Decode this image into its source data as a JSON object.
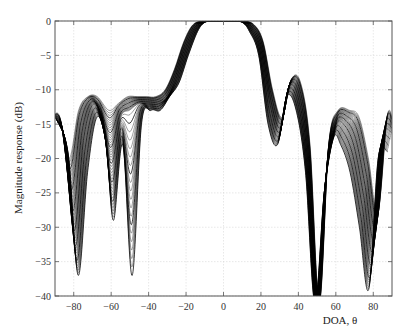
{
  "chart_data": {
    "type": "line",
    "title": "",
    "xlabel": "DOA, θ",
    "ylabel": "Magnitude response (dB)",
    "xlim": [
      -90,
      90
    ],
    "ylim": [
      -40,
      0
    ],
    "xticks": [
      -80,
      -60,
      -40,
      -20,
      0,
      20,
      40,
      60,
      80
    ],
    "yticks": [
      0,
      -5,
      -10,
      -15,
      -20,
      -25,
      -30,
      -35,
      -40
    ],
    "xtick_labels": [
      "−80",
      "−60",
      "−40",
      "−20",
      "0",
      "20",
      "40",
      "60",
      "80"
    ],
    "ytick_labels": [
      "0",
      "−5",
      "−10",
      "−15",
      "−20",
      "−25",
      "−30",
      "−35",
      "−40"
    ],
    "grid": true,
    "legend": null,
    "series_count": 40,
    "line_color": "#000000",
    "series": [
      {
        "name": "pattern-min",
        "x": [
          -90,
          -85,
          -80,
          -75,
          -70,
          -65,
          -60,
          -55,
          -50,
          -45,
          -40,
          -35,
          -30,
          -25,
          -20,
          -15,
          -10,
          -5,
          0,
          5,
          10,
          15,
          20,
          25,
          30,
          35,
          40,
          45,
          50,
          55,
          60,
          65,
          70,
          75,
          80,
          85,
          90
        ],
        "values": [
          -15,
          -20,
          -37,
          -22,
          -14,
          -18,
          -29,
          -18,
          -37,
          -15,
          -13,
          -13,
          -11,
          -9,
          -5,
          -1.5,
          -0.2,
          0,
          0,
          0,
          -0.2,
          -1.5,
          -5,
          -15,
          -18,
          -11,
          -13,
          -22,
          -40,
          -25,
          -17,
          -18,
          -22,
          -30,
          -39,
          -20,
          -19
        ]
      },
      {
        "name": "pattern-mid",
        "x": [
          -90,
          -85,
          -80,
          -75,
          -70,
          -65,
          -60,
          -55,
          -50,
          -45,
          -40,
          -35,
          -30,
          -25,
          -20,
          -15,
          -10,
          -5,
          0,
          5,
          10,
          15,
          20,
          25,
          30,
          35,
          40,
          45,
          50,
          55,
          60,
          65,
          70,
          75,
          80,
          85,
          90
        ],
        "values": [
          -14,
          -17,
          -30,
          -17,
          -12,
          -14,
          -20,
          -14,
          -13,
          -12,
          -12,
          -12,
          -11,
          -8,
          -4,
          -1,
          0,
          0,
          0,
          0,
          0,
          -1,
          -4,
          -12,
          -16,
          -9.5,
          -11,
          -20,
          -40,
          -22,
          -15,
          -15,
          -18,
          -25,
          -33,
          -17,
          -16
        ]
      },
      {
        "name": "pattern-max",
        "x": [
          -90,
          -85,
          -80,
          -75,
          -70,
          -65,
          -60,
          -55,
          -50,
          -45,
          -40,
          -35,
          -30,
          -25,
          -20,
          -15,
          -10,
          -5,
          0,
          5,
          10,
          15,
          20,
          25,
          30,
          35,
          40,
          45,
          50,
          55,
          60,
          65,
          70,
          75,
          80,
          85,
          90
        ],
        "values": [
          -13.5,
          -14,
          -20,
          -13,
          -11,
          -11,
          -13,
          -12,
          -11,
          -11,
          -11,
          -11,
          -10,
          -7,
          -3,
          -0.5,
          0,
          0,
          0,
          0,
          0,
          -0.5,
          -3,
          -10,
          -14,
          -8.5,
          -9,
          -18,
          -40,
          -18,
          -13,
          -13,
          -14,
          -20,
          -28,
          -14,
          -14
        ]
      }
    ]
  }
}
